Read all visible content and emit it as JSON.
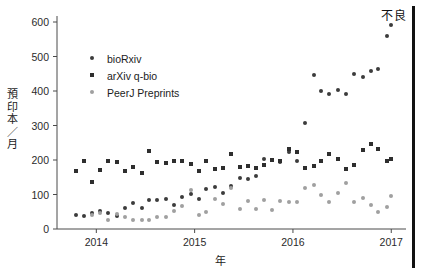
{
  "chart": {
    "ylabel": "預印本／月",
    "xlabel": "年",
    "annotation": "不良"
  },
  "chart_data": {
    "type": "scatter",
    "title": "",
    "xlabel": "年",
    "ylabel": "預印本／月",
    "xlim": [
      2013.6,
      2017.15
    ],
    "ylim": [
      0,
      600
    ],
    "yticks": [
      0,
      100,
      200,
      300,
      400,
      500,
      600
    ],
    "xticks": [
      2014,
      2015,
      2016,
      2017
    ],
    "grid": false,
    "legend_position": "upper-left",
    "annotations": [
      {
        "text": "不良",
        "position": "top-right"
      }
    ],
    "colors": {
      "bioRxiv": "#3c3c3c",
      "arXiv q-bio": "#2e2e2e",
      "PeerJ Preprints": "#a0a0a0",
      "rule": "#111111"
    },
    "series": [
      {
        "name": "bioRxiv",
        "marker": "circle",
        "x": [
          2013.79,
          2013.87,
          2013.96,
          2014.04,
          2014.12,
          2014.21,
          2014.29,
          2014.37,
          2014.46,
          2014.54,
          2014.62,
          2014.71,
          2014.79,
          2014.87,
          2014.96,
          2015.04,
          2015.12,
          2015.21,
          2015.29,
          2015.37,
          2015.46,
          2015.54,
          2015.62,
          2015.71,
          2015.79,
          2015.87,
          2015.96,
          2016.04,
          2016.12,
          2016.21,
          2016.29,
          2016.37,
          2016.46,
          2016.54,
          2016.62,
          2016.71,
          2016.79,
          2016.87,
          2016.96,
          2017.0
        ],
        "y": [
          40,
          39,
          45,
          52,
          45,
          38,
          62,
          76,
          60,
          83,
          84,
          86,
          70,
          93,
          102,
          87,
          117,
          121,
          104,
          125,
          148,
          145,
          153,
          203,
          200,
          195,
          224,
          196,
          306,
          445,
          400,
          390,
          403,
          390,
          450,
          440,
          459,
          465,
          560,
          590
        ]
      },
      {
        "name": "arXiv q-bio",
        "marker": "square",
        "x": [
          2013.79,
          2013.87,
          2013.96,
          2014.04,
          2014.12,
          2014.21,
          2014.29,
          2014.37,
          2014.46,
          2014.54,
          2014.62,
          2014.71,
          2014.79,
          2014.87,
          2014.96,
          2015.04,
          2015.12,
          2015.21,
          2015.29,
          2015.37,
          2015.46,
          2015.54,
          2015.62,
          2015.71,
          2015.79,
          2015.87,
          2015.96,
          2016.04,
          2016.12,
          2016.21,
          2016.29,
          2016.37,
          2016.46,
          2016.54,
          2016.62,
          2016.71,
          2016.79,
          2016.87,
          2016.96,
          2017.0
        ],
        "y": [
          168,
          198,
          137,
          171,
          196,
          193,
          167,
          180,
          163,
          227,
          193,
          192,
          196,
          198,
          188,
          168,
          196,
          173,
          178,
          217,
          180,
          182,
          177,
          185,
          201,
          198,
          231,
          222,
          178,
          182,
          196,
          217,
          202,
          174,
          186,
          229,
          247,
          231,
          196,
          203
        ]
      },
      {
        "name": "PeerJ Preprints",
        "marker": "cross",
        "x": [
          2013.96,
          2014.04,
          2014.12,
          2014.21,
          2014.29,
          2014.37,
          2014.46,
          2014.54,
          2014.62,
          2014.71,
          2014.79,
          2014.87,
          2014.96,
          2015.04,
          2015.12,
          2015.21,
          2015.29,
          2015.37,
          2015.46,
          2015.54,
          2015.62,
          2015.71,
          2015.79,
          2015.87,
          2015.96,
          2016.04,
          2016.12,
          2016.21,
          2016.29,
          2016.37,
          2016.46,
          2016.54,
          2016.62,
          2016.71,
          2016.79,
          2016.87,
          2016.96,
          2017.0
        ],
        "y": [
          42,
          47,
          25,
          43,
          35,
          26,
          27,
          26,
          36,
          35,
          53,
          67,
          114,
          42,
          50,
          86,
          73,
          120,
          57,
          80,
          57,
          85,
          56,
          82,
          77,
          77,
          118,
          128,
          99,
          79,
          103,
          134,
          79,
          90,
          71,
          50,
          63,
          95
        ]
      }
    ]
  },
  "legend": [
    {
      "label": "bioRxiv",
      "series": 0
    },
    {
      "label": "arXiv q-bio",
      "series": 1
    },
    {
      "label": "PeerJ Preprints",
      "series": 2
    }
  ],
  "axis": {
    "yticklabels": [
      "600",
      "500",
      "400",
      "300",
      "200",
      "100",
      "0"
    ],
    "xticklabels": [
      "2014",
      "2015",
      "2016",
      "2017"
    ]
  }
}
